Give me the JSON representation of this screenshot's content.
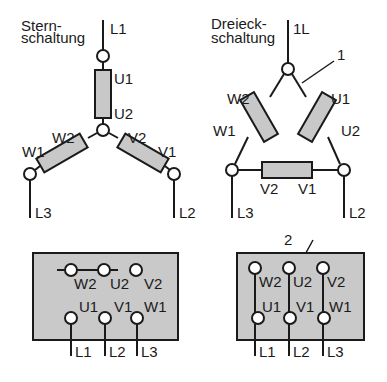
{
  "star": {
    "title_line1": "Stern-",
    "title_line2": "schaltung",
    "supply": [
      "L1",
      "L2",
      "L3"
    ],
    "winding_labels": {
      "U1": "U1",
      "U2": "U2",
      "V1": "V1",
      "V2": "V2",
      "W1": "W1",
      "W2": "W2"
    }
  },
  "delta": {
    "title_line1": "Dreieck-",
    "title_line2": "schaltung",
    "supply_top": "1L",
    "supply": [
      "L2",
      "L3"
    ],
    "winding_labels": {
      "U1": "U1",
      "U2": "U2",
      "V1": "V1",
      "V2": "V2",
      "W1": "W1",
      "W2": "W2"
    },
    "callout_1": "1"
  },
  "star_terminal_box": {
    "top_row": [
      "W2",
      "U2",
      "V2"
    ],
    "bottom_row": [
      "U1",
      "V1",
      "W1"
    ],
    "supply": [
      "L1",
      "L2",
      "L3"
    ]
  },
  "delta_terminal_box": {
    "callout_2": "2",
    "top_row": [
      "W2",
      "U2",
      "V2"
    ],
    "bottom_row": [
      "U1",
      "V1",
      "W1"
    ],
    "supply": [
      "L1",
      "L2",
      "L3"
    ]
  }
}
